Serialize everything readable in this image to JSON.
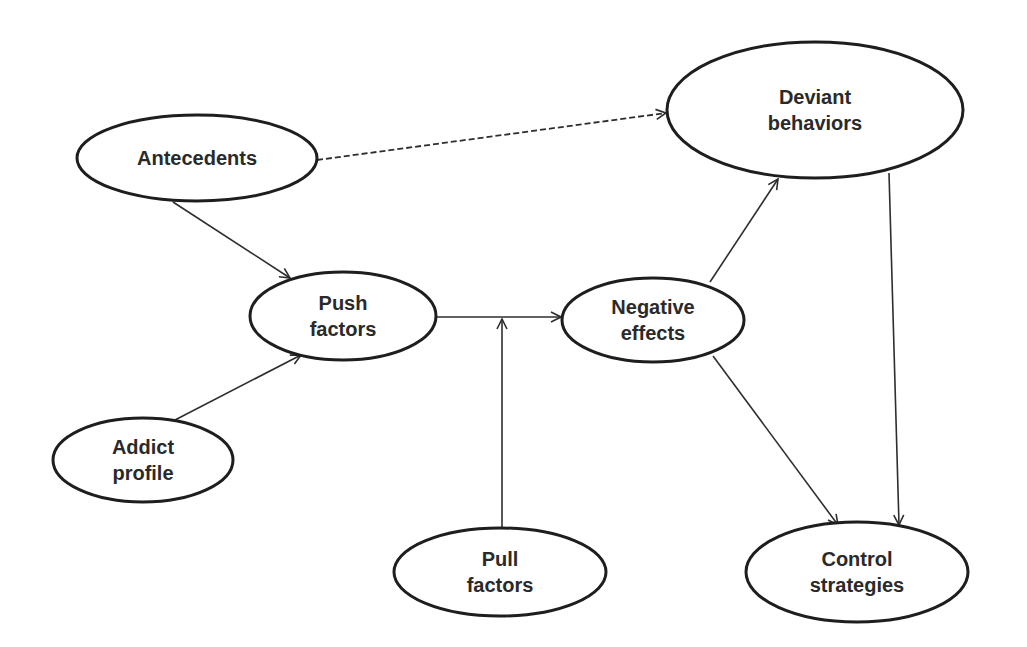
{
  "diagram": {
    "type": "flow-model",
    "colors": {
      "stroke": "#1e1e1e",
      "text": "#2a2a2a",
      "background": "#ffffff"
    },
    "nodes": [
      {
        "id": "antecedents",
        "lines": [
          "Antecedents"
        ],
        "cx": 197,
        "cy": 158,
        "rx": 120,
        "ry": 43
      },
      {
        "id": "deviant",
        "lines": [
          "Deviant",
          "behaviors"
        ],
        "cx": 815,
        "cy": 110,
        "rx": 148,
        "ry": 68
      },
      {
        "id": "push",
        "lines": [
          "Push",
          "factors"
        ],
        "cx": 343,
        "cy": 316,
        "rx": 93,
        "ry": 44
      },
      {
        "id": "negative",
        "lines": [
          "Negative",
          "effects"
        ],
        "cx": 653,
        "cy": 320,
        "rx": 91,
        "ry": 42
      },
      {
        "id": "addict",
        "lines": [
          "Addict",
          "profile"
        ],
        "cx": 143,
        "cy": 460,
        "rx": 90,
        "ry": 42
      },
      {
        "id": "pull",
        "lines": [
          "Pull",
          "factors"
        ],
        "cx": 500,
        "cy": 572,
        "rx": 106,
        "ry": 44
      },
      {
        "id": "control",
        "lines": [
          "Control",
          "strategies"
        ],
        "cx": 857,
        "cy": 572,
        "rx": 111,
        "ry": 50
      }
    ],
    "edges": [
      {
        "from": "antecedents",
        "to": "deviant",
        "style": "dashed",
        "x1": 317,
        "y1": 160,
        "x2": 666,
        "y2": 113
      },
      {
        "from": "antecedents",
        "to": "push",
        "style": "solid",
        "x1": 173,
        "y1": 202,
        "x2": 290,
        "y2": 278
      },
      {
        "from": "addict",
        "to": "push",
        "style": "solid",
        "x1": 175,
        "y1": 420,
        "x2": 301,
        "y2": 355
      },
      {
        "from": "push",
        "to": "negative",
        "style": "solid",
        "x1": 437,
        "y1": 317,
        "x2": 561,
        "y2": 317
      },
      {
        "from": "pull",
        "to": "push-negative-link",
        "style": "solid",
        "x1": 502,
        "y1": 528,
        "x2": 502,
        "y2": 319
      },
      {
        "from": "negative",
        "to": "deviant",
        "style": "solid",
        "x1": 710,
        "y1": 282,
        "x2": 778,
        "y2": 179
      },
      {
        "from": "negative",
        "to": "control",
        "style": "solid",
        "x1": 713,
        "y1": 356,
        "x2": 838,
        "y2": 525
      },
      {
        "from": "deviant",
        "to": "control",
        "style": "solid",
        "x1": 889,
        "y1": 173,
        "x2": 899,
        "y2": 525
      }
    ]
  }
}
